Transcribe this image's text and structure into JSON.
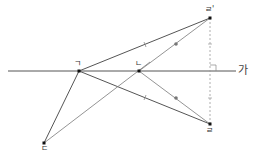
{
  "diagram": {
    "line_label": "가",
    "points": {
      "giyeok": {
        "label": "ㄱ",
        "x": 79,
        "y": 71
      },
      "nieun": {
        "label": "ㄴ",
        "x": 139,
        "y": 71
      },
      "digeut": {
        "label": "ㄷ",
        "x": 44,
        "y": 143
      },
      "rieul": {
        "label": "ㄹ",
        "x": 210,
        "y": 124
      },
      "rieul_prime": {
        "label": "ㄹ'",
        "x": 210,
        "y": 18
      }
    },
    "colors": {
      "line": "#555555",
      "light_line": "#888888",
      "dashed": "#999999",
      "point": "#111111"
    }
  }
}
